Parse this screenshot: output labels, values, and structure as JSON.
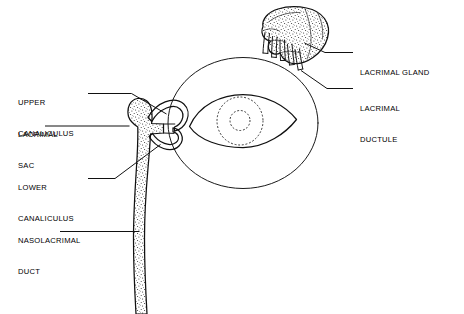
{
  "figure": {
    "background_color": "#ffffff",
    "ink_color": "#111111",
    "width": 464,
    "height": 314
  },
  "labels": {
    "upper_canaliculus": {
      "line1": "UPPER",
      "line2": "CANALICULUS"
    },
    "lacrimal_sac": {
      "line1": "LACRIMAL",
      "line2": "SAC"
    },
    "lower_canaliculus": {
      "line1": "LOWER",
      "line2": "CANALICULUS"
    },
    "nasolacrimal_duct": {
      "line1": "NASOLACRIMAL",
      "line2": "DUCT"
    },
    "lacrimal_gland": {
      "line1": "LACRIMAL GLAND"
    },
    "lacrimal_ductule": {
      "line1": "LACRIMAL",
      "line2": "DUCTULE"
    }
  },
  "structures": {
    "lacrimal_gland": "lacrimal-gland",
    "lacrimal_ductules": "lacrimal-ductules",
    "orbit": "orbit-outline",
    "palpebral_fissure": "palpebral-fissure",
    "iris": "iris-dashed-circle",
    "pupil": "pupil-dashed-circle",
    "upper_canaliculus": "upper-canaliculus",
    "lower_canaliculus": "lower-canaliculus",
    "lacrimal_sac": "lacrimal-sac",
    "nasolacrimal_duct": "nasolacrimal-duct"
  }
}
